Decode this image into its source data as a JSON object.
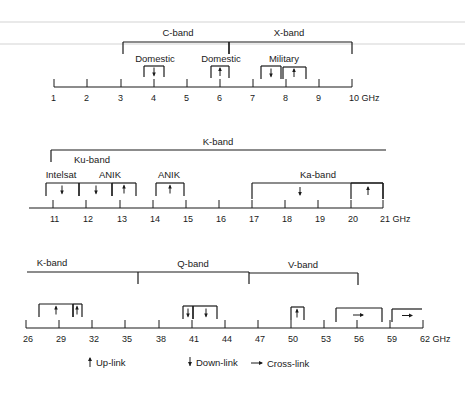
{
  "colors": {
    "ink": "#1a1a1a",
    "background": "#ffffff"
  },
  "legend": {
    "uplink": {
      "icon": "up-arrow-icon",
      "label": "Up-link"
    },
    "downlink": {
      "icon": "down-arrow-icon",
      "label": "Down-link"
    },
    "crosslink": {
      "icon": "right-arrow-icon",
      "label": "Cross-link"
    }
  },
  "rows": [
    {
      "id": "row1",
      "axis": {
        "y": 87,
        "x_start": 54,
        "x_end": 352,
        "ticks": [
          {
            "label": "1",
            "x": 54
          },
          {
            "label": "2",
            "x": 87
          },
          {
            "label": "3",
            "x": 121
          },
          {
            "label": "4",
            "x": 154
          },
          {
            "label": "5",
            "x": 187
          },
          {
            "label": "6",
            "x": 220
          },
          {
            "label": "7",
            "x": 253
          },
          {
            "label": "8",
            "x": 286
          },
          {
            "label": "9",
            "x": 319
          },
          {
            "label": "10 GHz",
            "x": 352
          }
        ]
      },
      "bands": [
        {
          "name": "C-band",
          "label_x": 178,
          "label_y": 36,
          "x1": 123,
          "x2": 229,
          "y": 42,
          "drop": 12
        },
        {
          "name": "X-band",
          "label_x": 289,
          "label_y": 36,
          "x1": 229,
          "x2": 352,
          "y": 42,
          "drop": 12
        }
      ],
      "allocations": [
        {
          "service": "Domestic",
          "label_x": 155,
          "label_y": 62,
          "x1": 144,
          "x2": 164,
          "top": 66,
          "bottom": 77,
          "arrow": "down",
          "arrow_x": 154
        },
        {
          "service": "Domestic",
          "label_x": 221,
          "label_y": 62,
          "x1": 211,
          "x2": 229,
          "top": 66,
          "bottom": 78,
          "arrow": "up",
          "arrow_x": 220
        },
        {
          "service": "Military",
          "label_x": 284,
          "label_y": 62,
          "x1": 261,
          "x2": 281,
          "top": 66,
          "bottom": 79,
          "arrow": "down",
          "arrow_x": 271
        },
        {
          "service": "",
          "label_x": 0,
          "label_y": 0,
          "x1": 283,
          "x2": 306,
          "top": 67,
          "bottom": 79,
          "arrow": "up",
          "arrow_x": 294
        }
      ]
    },
    {
      "id": "row2",
      "axis": {
        "y": 208,
        "x_start": 29,
        "x_end": 383,
        "ticks": [
          {
            "label": "11",
            "x": 53
          },
          {
            "label": "12",
            "x": 86
          },
          {
            "label": "13",
            "x": 120
          },
          {
            "label": "14",
            "x": 153
          },
          {
            "label": "15",
            "x": 186
          },
          {
            "label": "16",
            "x": 219
          },
          {
            "label": "17",
            "x": 252
          },
          {
            "label": "18",
            "x": 285
          },
          {
            "label": "19",
            "x": 318
          },
          {
            "label": "20",
            "x": 351
          },
          {
            "label": "21 GHz",
            "x": 383
          }
        ]
      },
      "bands": [
        {
          "name": "K-band",
          "label_x": 218,
          "label_y": 145,
          "x1": 51,
          "x2": 386,
          "y": 150,
          "drop_left": 12,
          "drop_right": 0
        },
        {
          "name": "Ku-band",
          "label_x": 92,
          "label_y": 163,
          "plain": true
        }
      ],
      "allocations": [
        {
          "service": "Intelsat",
          "label_x": 61,
          "label_y": 178,
          "x1": 46,
          "x2": 79,
          "top": 183,
          "bottom": 196,
          "arrow": "down",
          "arrow_x": 62
        },
        {
          "service": "ANIK",
          "label_x": 110,
          "label_y": 178,
          "x1": 79,
          "x2": 112,
          "top": 183,
          "bottom": 196,
          "arrow": "down",
          "arrow_x": 96
        },
        {
          "service": "",
          "label_x": 0,
          "label_y": 0,
          "x1": 112,
          "x2": 136,
          "top": 183,
          "bottom": 196,
          "arrow": "up",
          "arrow_x": 124
        },
        {
          "service": "ANIK",
          "label_x": 169,
          "label_y": 178,
          "x1": 156,
          "x2": 184,
          "top": 183,
          "bottom": 196,
          "arrow": "up",
          "arrow_x": 170
        },
        {
          "service": "Ka-band",
          "label_x": 318,
          "label_y": 178,
          "x1": 252,
          "x2": 383,
          "top": 183,
          "bottom": 199,
          "arrow": "down",
          "arrow_x": 300
        },
        {
          "service": "",
          "label_x": 0,
          "label_y": 0,
          "x1": 351,
          "x2": 383,
          "top": 183,
          "bottom": 199,
          "arrow": "up",
          "arrow_x": 368
        }
      ]
    },
    {
      "id": "row3",
      "axis": {
        "y": 328,
        "x_start": 26,
        "x_end": 423,
        "ticks": [
          {
            "label": "26",
            "x": 26
          },
          {
            "label": "29",
            "x": 59
          },
          {
            "label": "32",
            "x": 92
          },
          {
            "label": "35",
            "x": 125
          },
          {
            "label": "38",
            "x": 159
          },
          {
            "label": "41",
            "x": 192
          },
          {
            "label": "44",
            "x": 225
          },
          {
            "label": "47",
            "x": 258
          },
          {
            "label": "50",
            "x": 291
          },
          {
            "label": "53",
            "x": 324
          },
          {
            "label": "56",
            "x": 357
          },
          {
            "label": "59",
            "x": 390
          },
          {
            "label": "62 GHz",
            "x": 423
          }
        ]
      },
      "bands": [
        {
          "name": "K-band",
          "label_x": 52,
          "label_y": 266,
          "x1": 27,
          "x2": 138,
          "y": 272,
          "drop_left": 0,
          "drop_right": 12
        },
        {
          "name": "Q-band",
          "label_x": 193,
          "label_y": 267,
          "x1": 138,
          "x2": 249,
          "y": 272,
          "drop_left": 0,
          "drop_right": 12
        },
        {
          "name": "V-band",
          "label_x": 303,
          "label_y": 268,
          "x1": 249,
          "x2": 358,
          "y": 273,
          "drop_left": 0,
          "drop_right": 12
        }
      ],
      "allocations": [
        {
          "service": "",
          "x1": 39,
          "x2": 73,
          "top": 304,
          "bottom": 317,
          "arrow": "up",
          "arrow_x": 56
        },
        {
          "service": "",
          "x1": 73,
          "x2": 82,
          "top": 304,
          "bottom": 317,
          "arrow": "up",
          "arrow_x": 77
        },
        {
          "service": "",
          "x1": 183,
          "x2": 193,
          "top": 306,
          "bottom": 319,
          "arrow": "down",
          "arrow_x": 188
        },
        {
          "service": "",
          "x1": 193,
          "x2": 217,
          "top": 306,
          "bottom": 319,
          "arrow": "down",
          "arrow_x": 206
        },
        {
          "service": "",
          "x1": 291,
          "x2": 304,
          "top": 307,
          "bottom": 320,
          "arrow": "up",
          "arrow_x": 297
        },
        {
          "service": "",
          "x1": 336,
          "x2": 382,
          "top": 308,
          "bottom": 322,
          "arrow": "right",
          "arrow_x": 358
        },
        {
          "service": "",
          "x1": 392,
          "x2": 422,
          "top": 309,
          "bottom": 322,
          "arrow": "right",
          "arrow_x": 407,
          "open_right": true
        }
      ]
    }
  ]
}
